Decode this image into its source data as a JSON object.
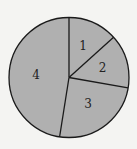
{
  "chart_data": {
    "type": "pie",
    "title": "",
    "categories": [
      "1",
      "2",
      "3",
      "4"
    ],
    "values": [
      48,
      52,
      89,
      171
    ],
    "unit": "degrees (estimated)",
    "start_angle_deg_from_north_clockwise": 0,
    "fill_color": "#b0b0b0",
    "stroke_color": "#1a1a1a",
    "legend": "none"
  },
  "labels": [
    "1",
    "2",
    "3",
    "4"
  ]
}
